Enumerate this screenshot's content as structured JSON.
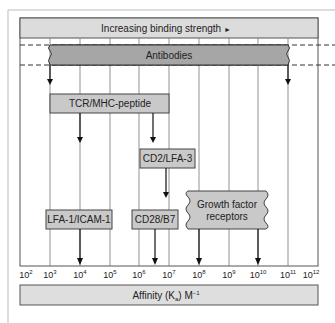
{
  "diagram": {
    "header": {
      "label": "Increasing binding strength",
      "arrow_glyph": "►"
    },
    "axis": {
      "label_prefix": "Affinity (K",
      "label_sub": "a",
      "label_suffix": ") M",
      "label_sup": "−1",
      "ticks": [
        {
          "base": "10",
          "exp": "2"
        },
        {
          "base": "10",
          "exp": "3"
        },
        {
          "base": "10",
          "exp": "4"
        },
        {
          "base": "10",
          "exp": "5"
        },
        {
          "base": "10",
          "exp": "6"
        },
        {
          "base": "10",
          "exp": "7"
        },
        {
          "base": "10",
          "exp": "8"
        },
        {
          "base": "10",
          "exp": "9"
        },
        {
          "base": "10",
          "exp": "10"
        },
        {
          "base": "10",
          "exp": "11"
        },
        {
          "base": "10",
          "exp": "12"
        }
      ]
    },
    "bands": {
      "antibodies": {
        "label": "Antibodies",
        "range": [
          "10^3",
          "10^11"
        ]
      }
    },
    "boxes": {
      "tcr": {
        "label": "TCR/MHC-peptide",
        "arrows_to": [
          "10^4",
          "~10^6.5"
        ]
      },
      "cd2": {
        "label": "CD2/LFA-3"
      },
      "lfa1": {
        "label": "LFA-1/ICAM-1",
        "arrow_to": "10^4"
      },
      "cd28": {
        "label": "CD28/B7",
        "arrow_to": "~10^6.5"
      },
      "growth": {
        "label_line1": "Growth factor",
        "label_line2": "receptors",
        "arrows_to": [
          "10^8",
          "10^10"
        ]
      }
    },
    "colors": {
      "header_fill": "#dcdcdc",
      "antibody_fill": "#a6a6a6",
      "box_fill": "#c9c9c9",
      "axis_bar_fill": "#dedede",
      "line": "#333333"
    }
  }
}
